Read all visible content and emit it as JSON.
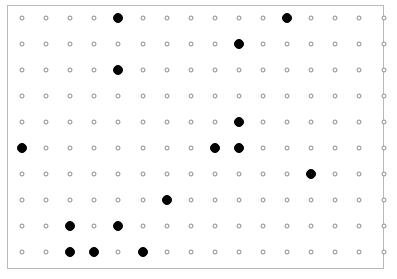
{
  "figure": {
    "kind": "dot-grid",
    "canvas": {
      "width": 397,
      "height": 279,
      "background_color": "#ffffff"
    },
    "frame": {
      "x": 7,
      "y": 5,
      "width": 377,
      "height": 264,
      "border_color": "#b9b9b9",
      "border_width": 1,
      "fill_color": "#ffffff"
    },
    "grid": {
      "columns": 16,
      "rows": 10,
      "origin_x": 22,
      "origin_y": 18,
      "spacing_x": 24.1,
      "spacing_y": 26.0
    },
    "markers": {
      "hollow": {
        "label": "open circle",
        "diameter": 5,
        "stroke_color": "#8a8a8a",
        "stroke_width": 1,
        "fill_color": "#ffffff"
      },
      "filled": {
        "label": "solid circle",
        "diameter": 10,
        "stroke_color": "#000000",
        "stroke_width": 1,
        "fill_color": "#000000"
      }
    }
  },
  "chart_data": {
    "type": "scatter",
    "title": "",
    "subtitle": "",
    "xlabel": "",
    "ylabel": "",
    "grid": true,
    "legend": null,
    "annotations": [],
    "x": [
      1,
      2,
      3,
      4,
      5,
      6,
      7,
      8,
      9,
      10,
      11,
      12,
      13,
      14,
      15,
      16
    ],
    "xlim": [
      1,
      16
    ],
    "ylim": [
      1,
      10
    ],
    "xticklabels": [
      "1",
      "2",
      "3",
      "4",
      "5",
      "6",
      "7",
      "8",
      "9",
      "10",
      "11",
      "12",
      "13",
      "14",
      "15",
      "16"
    ],
    "yticklabels": [
      "1",
      "2",
      "3",
      "4",
      "5",
      "6",
      "7",
      "8",
      "9",
      "10"
    ],
    "categories": [
      "1",
      "2",
      "3",
      "4",
      "5",
      "6",
      "7",
      "8",
      "9",
      "10",
      "11",
      "12",
      "13",
      "14",
      "15",
      "16"
    ],
    "n_rows": 10,
    "n_cols": 16,
    "n_total_points": 160,
    "n_filled_points": 13,
    "n_hollow_points": 147,
    "series": [
      {
        "name": "filled",
        "marker": "solid circle",
        "points": [
          {
            "row": 1,
            "col": 5
          },
          {
            "row": 1,
            "col": 12
          },
          {
            "row": 2,
            "col": 10
          },
          {
            "row": 3,
            "col": 5
          },
          {
            "row": 5,
            "col": 10
          },
          {
            "row": 6,
            "col": 1
          },
          {
            "row": 6,
            "col": 9
          },
          {
            "row": 6,
            "col": 10
          },
          {
            "row": 7,
            "col": 13
          },
          {
            "row": 8,
            "col": 7
          },
          {
            "row": 9,
            "col": 3
          },
          {
            "row": 9,
            "col": 5
          },
          {
            "row": 10,
            "col": 3
          },
          {
            "row": 10,
            "col": 4
          },
          {
            "row": 10,
            "col": 6
          }
        ]
      }
    ],
    "matrix": [
      [
        0,
        0,
        0,
        0,
        1,
        0,
        0,
        0,
        0,
        0,
        0,
        1,
        0,
        0,
        0,
        0
      ],
      [
        0,
        0,
        0,
        0,
        0,
        0,
        0,
        0,
        0,
        1,
        0,
        0,
        0,
        0,
        0,
        0
      ],
      [
        0,
        0,
        0,
        0,
        1,
        0,
        0,
        0,
        0,
        0,
        0,
        0,
        0,
        0,
        0,
        0
      ],
      [
        0,
        0,
        0,
        0,
        0,
        0,
        0,
        0,
        0,
        0,
        0,
        0,
        0,
        0,
        0,
        0
      ],
      [
        0,
        0,
        0,
        0,
        0,
        0,
        0,
        0,
        0,
        1,
        0,
        0,
        0,
        0,
        0,
        0
      ],
      [
        1,
        0,
        0,
        0,
        0,
        0,
        0,
        0,
        1,
        1,
        0,
        0,
        0,
        0,
        0,
        0
      ],
      [
        0,
        0,
        0,
        0,
        0,
        0,
        0,
        0,
        0,
        0,
        0,
        0,
        1,
        0,
        0,
        0
      ],
      [
        0,
        0,
        0,
        0,
        0,
        0,
        1,
        0,
        0,
        0,
        0,
        0,
        0,
        0,
        0,
        0
      ],
      [
        0,
        0,
        1,
        0,
        1,
        0,
        0,
        0,
        0,
        0,
        0,
        0,
        0,
        0,
        0,
        0
      ],
      [
        0,
        0,
        1,
        1,
        0,
        1,
        0,
        0,
        0,
        0,
        0,
        0,
        0,
        0,
        0,
        0
      ]
    ],
    "row_filled_counts": [
      2,
      1,
      1,
      0,
      1,
      3,
      1,
      1,
      2,
      3
    ]
  }
}
